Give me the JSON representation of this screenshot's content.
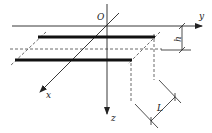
{
  "diagram": {
    "title": "",
    "labels": {
      "origin": "O",
      "x_axis": "x",
      "y_axis": "y",
      "z_axis": "z",
      "height_dim": "h",
      "length_dim": "L"
    },
    "elements": [
      {
        "type": "axis",
        "name": "y-axis",
        "direction": "right"
      },
      {
        "type": "axis",
        "name": "z-axis",
        "direction": "down"
      },
      {
        "type": "axis",
        "name": "x-axis",
        "direction": "diagonal-down-left"
      },
      {
        "type": "conductor",
        "name": "upper-bar",
        "style": "thick-solid"
      },
      {
        "type": "conductor",
        "name": "lower-bar",
        "style": "thick-solid"
      },
      {
        "type": "plane",
        "name": "conductor-plane",
        "style": "dashed"
      },
      {
        "type": "dimension",
        "name": "h",
        "meaning": "depth below y-axis"
      },
      {
        "type": "dimension",
        "name": "L",
        "meaning": "spacing between bars"
      }
    ],
    "colors": {
      "line": "#222222",
      "background": "#ffffff"
    }
  }
}
